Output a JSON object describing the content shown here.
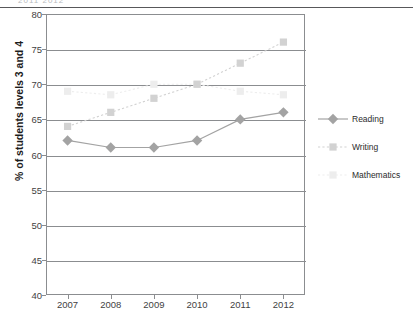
{
  "header": {
    "ghost_text": "2011  2012",
    "rule_color": "#58585a"
  },
  "chart_data": {
    "type": "line",
    "title": "",
    "xlabel": "",
    "ylabel": "% of students levels 3 and 4",
    "categories": [
      "2007",
      "2008",
      "2009",
      "2010",
      "2011",
      "2012"
    ],
    "x": [
      2007,
      2008,
      2009,
      2010,
      2011,
      2012
    ],
    "ylim": [
      40,
      80
    ],
    "yticks": [
      40,
      45,
      50,
      55,
      60,
      65,
      70,
      75,
      80
    ],
    "ytick_labels": [
      "40",
      "45",
      "50",
      "55",
      "60",
      "65",
      "70",
      "75",
      "80"
    ],
    "grid": true,
    "grid_axis": "y",
    "legend_position": "right",
    "series": [
      {
        "name": "Reading",
        "values": [
          62,
          61,
          61,
          62,
          65,
          66
        ],
        "color": "#a3a3a3",
        "marker": "diamond",
        "line_style": "solid"
      },
      {
        "name": "Writing",
        "values": [
          64,
          66,
          68,
          70,
          73,
          76
        ],
        "color": "#d2d2d2",
        "marker": "square",
        "line_style": "dotted"
      },
      {
        "name": "Mathematics",
        "values": [
          69,
          68.5,
          70,
          70,
          69,
          68.5
        ],
        "color": "#ededed",
        "marker": "square",
        "line_style": "dotted"
      }
    ]
  },
  "legend": {
    "items": [
      {
        "label": "Reading"
      },
      {
        "label": "Writing"
      },
      {
        "label": "Mathematics"
      }
    ]
  }
}
